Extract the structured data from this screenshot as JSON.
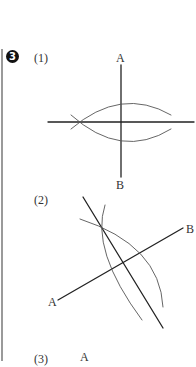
{
  "question": {
    "number_badge": "3",
    "parts": [
      {
        "label": "(1)",
        "points": {
          "top": "A",
          "bottom": "B"
        }
      },
      {
        "label": "(2)",
        "points": {
          "left": "A",
          "right": "B"
        }
      },
      {
        "label": "(3)",
        "points": {
          "top": "A"
        }
      }
    ]
  },
  "colors": {
    "line": "#222222",
    "arc": "#444444",
    "sidebar": "#9a9a9a"
  }
}
